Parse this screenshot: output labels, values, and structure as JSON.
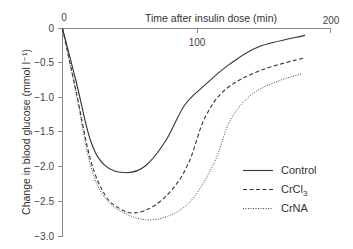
{
  "chart_data": {
    "type": "line",
    "title": "",
    "xlabel": "Time after insulin dose (min)",
    "ylabel": "Change in blood glucose (mmol l⁻¹)",
    "xlim": [
      0,
      200
    ],
    "ylim": [
      -3.0,
      0
    ],
    "x_ticks": [
      "0",
      "100",
      "200"
    ],
    "y_ticks": [
      "0",
      "−0.5",
      "−1.0",
      "−1.5",
      "−2.0",
      "−2.5",
      "−3.0"
    ],
    "x_axis_position": "top",
    "grid": false,
    "legend_position": "lower right",
    "series": [
      {
        "name": "Control",
        "style": "solid",
        "x": [
          0,
          10,
          21,
          32,
          48,
          62,
          77,
          91,
          106,
          125,
          147,
          181
        ],
        "values": [
          0,
          -0.75,
          -1.62,
          -1.98,
          -2.08,
          -1.98,
          -1.62,
          -1.11,
          -0.82,
          -0.51,
          -0.26,
          -0.1
        ]
      },
      {
        "name": "CrCl3",
        "style": "dashed",
        "x": [
          0,
          10,
          21,
          32,
          43,
          54,
          69,
          84,
          95,
          106,
          121,
          147,
          181
        ],
        "values": [
          0,
          -0.89,
          -1.9,
          -2.41,
          -2.6,
          -2.66,
          -2.55,
          -2.27,
          -1.9,
          -1.3,
          -0.89,
          -0.61,
          -0.42
        ]
      },
      {
        "name": "CrNA",
        "style": "dotted",
        "x": [
          0,
          10,
          21,
          32,
          47,
          65,
          84,
          99,
          114,
          125,
          140,
          158,
          179
        ],
        "values": [
          0,
          -0.92,
          -1.98,
          -2.45,
          -2.67,
          -2.76,
          -2.66,
          -2.41,
          -1.9,
          -1.33,
          -0.97,
          -0.78,
          -0.65
        ]
      }
    ]
  },
  "labels": {
    "x_axis_title": "Time after insulin dose (min)",
    "y_axis_title": "Change in blood glucose (mmol l⁻¹)",
    "x_tick_0": "0",
    "x_tick_100": "100",
    "x_tick_200": "200",
    "y_tick_0": "0",
    "y_tick_1": "−0.5",
    "y_tick_2": "−1.0",
    "y_tick_3": "−1.5",
    "y_tick_4": "−2.0",
    "y_tick_5": "−2.5",
    "y_tick_6": "−3.0"
  },
  "legend": {
    "items": [
      {
        "label": "Control",
        "sub": ""
      },
      {
        "label": "CrCl",
        "sub": "3"
      },
      {
        "label": "CrNA",
        "sub": ""
      }
    ]
  }
}
